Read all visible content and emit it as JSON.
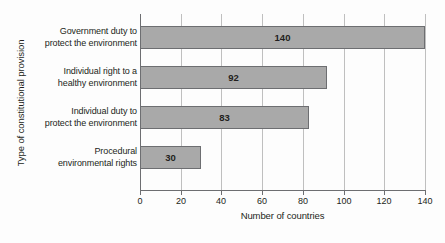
{
  "chart_data": {
    "type": "bar",
    "orientation": "horizontal",
    "title": "",
    "xlabel": "Number of countries",
    "ylabel": "Type of constitutional provision",
    "categories": [
      "Government duty to protect the environment",
      "Individual right to a healthy environment",
      "Individual duty to protect the environment",
      "Procedural environmental rights"
    ],
    "category_lines": [
      [
        "Government duty to",
        "protect the environment"
      ],
      [
        "Individual right to a",
        "healthy environment"
      ],
      [
        "Individual duty to",
        "protect the environment"
      ],
      [
        "Procedural",
        "environmental rights"
      ]
    ],
    "values": [
      140,
      92,
      83,
      30
    ],
    "value_labels": [
      "140",
      "92",
      "83",
      "30"
    ],
    "xlim": [
      0,
      140
    ],
    "xticks": [
      0,
      20,
      40,
      60,
      80,
      100,
      120,
      140
    ],
    "xtick_labels": [
      "0",
      "20",
      "40",
      "60",
      "80",
      "100",
      "120",
      "140"
    ],
    "grid": "vertical",
    "legend": "none",
    "colors": {
      "bar_fill": "#a9a9a9",
      "bar_border": "#6d6e71",
      "gridline": "#bfbfbf",
      "axis": "#6d6e71",
      "text": "#231f20",
      "background": "#fdfdfd"
    }
  }
}
